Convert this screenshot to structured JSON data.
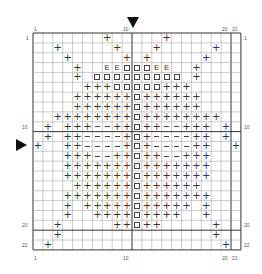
{
  "chart": {
    "title": "",
    "columns": 21,
    "rows": 22,
    "major_every": 10,
    "col_labels": [
      {
        "col": 1,
        "text": "1"
      },
      {
        "col": 10,
        "text": "10"
      },
      {
        "col": 20,
        "text": "20"
      },
      {
        "col": 21,
        "text": "21"
      }
    ],
    "row_labels": [
      {
        "row": 1,
        "text": "1"
      },
      {
        "row": 10,
        "text": "10"
      },
      {
        "row": 20,
        "text": "20"
      },
      {
        "row": 22,
        "text": "22"
      }
    ],
    "center_markers": {
      "column": 11,
      "row": 11
    },
    "legend_symbols": {
      "+": "plus",
      "□": "box",
      "E": "letter-e",
      "−": "dash"
    },
    "colors": {
      "grid_line": "#999999",
      "major_line": "#333333",
      "symbol": "#333333",
      "marker": "#111111"
    }
  },
  "chart_data": {
    "type": "heatmap",
    "xlabel": "",
    "ylabel": "",
    "x_tick_labels": [
      "1",
      "10",
      "20",
      "21"
    ],
    "y_tick_labels": [
      "1",
      "10",
      "20",
      "22"
    ],
    "grid": true,
    "dims": [
      21,
      22
    ],
    "pattern": [
      ".......+.....+.......",
      "..+.....+...+.....+..",
      "...+.....+.+.....+...",
      "....+..EE□□□EE..+....",
      "....+.□□□□□□□□□.+....",
      ".....+++□□□□□+++.....",
      "....++++++□++++++....",
      "....++++++□++++++....",
      "..++++++++□++++++++..",
      ".+.+++−−++□++−−+++.+.",
      ".+.++−−−−+□+−−−−++.+.",
      "+..++−−−−+□+−−−−++..+",
      "...+++−−++□++−−+++...",
      "...+++++++□+++++++...",
      "...+++++++□+++++++...",
      "....++++++□++++++....",
      "...+++++++□+++++++...",
      "...+.+++++□+++++.+...",
      "...+..++++□++++..+...",
      "..+.....++□++.....+..",
      "..+...............+..",
      ".+.................+."
    ]
  }
}
